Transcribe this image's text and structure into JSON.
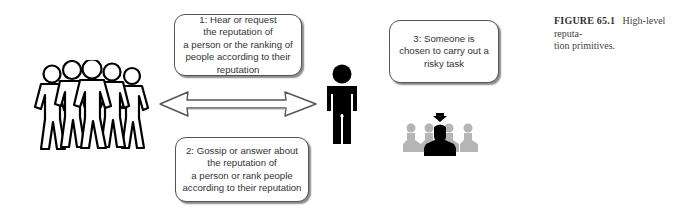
{
  "figure": {
    "label": "FIGURE 65.1",
    "caption": "High-level reputa-tion primitives.",
    "caption_line1": "High-level reputa-",
    "caption_line2": "tion primitives."
  },
  "boxes": [
    {
      "id": "step-1",
      "text": "1: Hear or request\nthe reputation of\na person or the ranking of\npeople according to their\nreputation"
    },
    {
      "id": "step-2",
      "text": "2: Gossip or answer about\nthe reputation of\na person or rank people\naccording to their reputation"
    },
    {
      "id": "step-3",
      "text": "3: Someone is\nchosen to carry out a\nrisky task"
    }
  ],
  "icons": {
    "crowd": "group-of-people-outline-icon",
    "person": "single-person-icon",
    "arrow": "double-headed-arrow-icon",
    "chosen": "chosen-person-among-group-icon"
  },
  "colors": {
    "box_border": "#555555",
    "text": "#333333",
    "figure_black": "#000000",
    "group_gray": "#b5b5b5"
  }
}
